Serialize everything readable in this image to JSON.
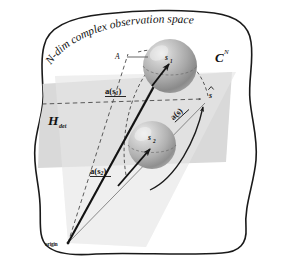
{
  "figure": {
    "title": "N-dim complex observation space",
    "background_color": "#ffffff",
    "outline_color": "#1a1a1a",
    "plane_fill": "#d8d8d8",
    "cone_fill": "#e8e8e8",
    "sphere_fill": "#b3b3b3",
    "sphere_highlight": "#e6e6e6",
    "sphere_shadow": "#7d7d7d",
    "accent_line_color": "#151515",
    "dashed_line_color": "#4a4a4a"
  },
  "labels": {
    "title": "N-dim complex observation space",
    "space_symbol": "C",
    "space_superscript": "N",
    "subspace_symbol": "H",
    "subspace_subscript": "det",
    "aperture": "A",
    "sphere_upper": "s",
    "sphere_upper_sub": "1",
    "sphere_lower": "s",
    "sphere_lower_sub": "2",
    "vector_upper": "a(s",
    "vector_upper_sub": "1",
    "vector_upper_close": ")",
    "vector_lower": "a(s",
    "vector_lower_sub": "2",
    "vector_lower_close": ")",
    "vector_estimate": "a(s)",
    "estimate_point": "s",
    "origin": "origin"
  },
  "geometry": {
    "width": 286,
    "height": 273,
    "origin_point": {
      "x": 68,
      "y": 243
    },
    "sphere_upper_center": {
      "x": 170,
      "y": 66
    },
    "sphere_upper_radius": 27,
    "sphere_lower_center": {
      "x": 152,
      "y": 145
    },
    "sphere_lower_radius": 24,
    "estimate_point_xy": {
      "x": 206,
      "y": 100
    }
  }
}
